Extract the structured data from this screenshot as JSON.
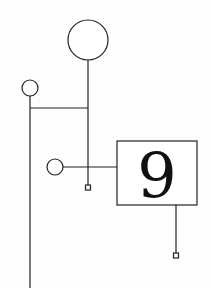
{
  "diagram": {
    "background": "#fdfdfd",
    "stroke_color": "#222222",
    "box_label": "9",
    "nodes": [
      {
        "id": "large-circle",
        "shape": "circle",
        "cx": 88,
        "cy": 40,
        "r": 20
      },
      {
        "id": "small-circle-left",
        "shape": "circle",
        "cx": 30,
        "cy": 88,
        "r": 8
      },
      {
        "id": "small-circle-mid",
        "shape": "circle",
        "cx": 55,
        "cy": 167,
        "r": 8
      },
      {
        "id": "number-box",
        "shape": "rect",
        "x": 117,
        "y": 141,
        "w": 80,
        "h": 64,
        "label": "9"
      },
      {
        "id": "terminal-square-mid",
        "shape": "square",
        "cx": 88,
        "cy": 187,
        "size": 5
      },
      {
        "id": "terminal-square-right",
        "shape": "square",
        "cx": 176,
        "cy": 255,
        "size": 5
      }
    ],
    "edges": [
      {
        "from": "large-circle",
        "to": "terminal-square-mid",
        "path": "vertical x=88 from y=60 to y=185"
      },
      {
        "from": "small-circle-left",
        "to": "bottom-edge",
        "path": "vertical x=30 from y=96 to y=288"
      },
      {
        "from": "small-circle-left-stem",
        "to": "large-circle-stem",
        "path": "horizontal y=108 from x=30 to x=88"
      },
      {
        "from": "small-circle-mid",
        "to": "number-box",
        "path": "horizontal y=167 from x=63 to x=117"
      },
      {
        "from": "number-box",
        "to": "terminal-square-right",
        "path": "vertical x=176 from y=205 to y=253"
      }
    ]
  }
}
